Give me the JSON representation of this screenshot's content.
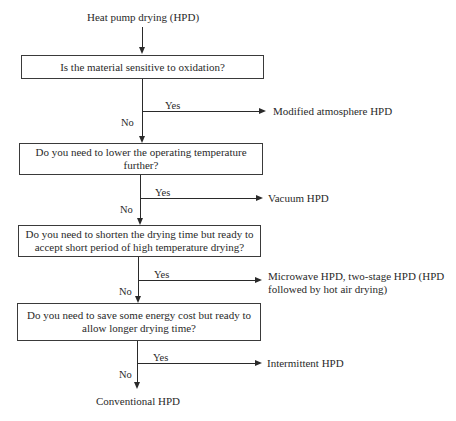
{
  "diagram": {
    "title": "Heat pump drying (HPD)",
    "nodes": [
      {
        "id": "q1",
        "text": "Is the material sensitive to oxidation?",
        "yes_outcome": "Modified atmosphere HPD"
      },
      {
        "id": "q2",
        "text": "Do you need to lower the operating temperature further?",
        "yes_outcome": "Vacuum HPD"
      },
      {
        "id": "q3",
        "text": "Do you need to shorten the drying time but ready to accept short period of high temperature drying?",
        "yes_outcome": "Microwave HPD, two-stage HPD (HPD followed by hot air drying)"
      },
      {
        "id": "q4",
        "text": "Do you need to save some energy cost but ready to allow longer drying time?",
        "yes_outcome": "Intermittent HPD"
      }
    ],
    "yes_label": "Yes",
    "no_label": "No",
    "final_outcome": "Conventional HPD"
  }
}
